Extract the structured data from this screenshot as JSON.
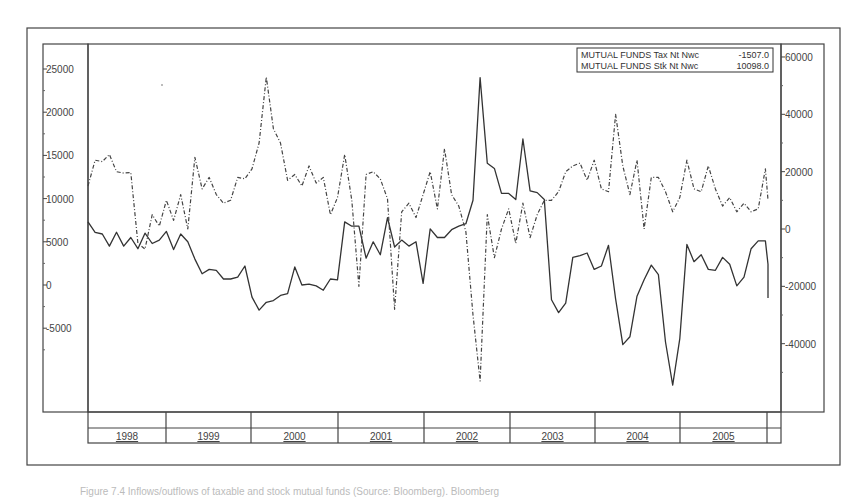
{
  "chart_data": {
    "type": "line",
    "title": "",
    "xlabel": "",
    "ylabel_left": "",
    "ylabel_right": "",
    "x_start": "1998-01",
    "x_step": "month",
    "x_tick_labels": [
      "1998",
      "1999",
      "2000",
      "2001",
      "2002",
      "2003",
      "2004",
      "2005"
    ],
    "left_axis": {
      "ticks": [
        25000,
        20000,
        15000,
        10000,
        5000,
        0,
        -5000
      ],
      "tick_labels": [
        "25000",
        "20000",
        "15000",
        "10000",
        "5000",
        "0",
        "-5000"
      ],
      "ylim": [
        -14500,
        28000
      ]
    },
    "right_axis": {
      "ticks": [
        60000,
        40000,
        20000,
        0,
        -20000,
        -40000
      ],
      "tick_labels": [
        "60000",
        "40000",
        "20000",
        "0",
        "-20000",
        "-40000"
      ],
      "ylim": [
        -63000,
        64000
      ]
    },
    "grid": false,
    "legend_position": "top-right inside plot",
    "series": [
      {
        "name": "MUTUAL FUNDS Tax Nt Nwc",
        "axis": "left",
        "style": "solid",
        "last_value": -1507.0,
        "values": [
          7300,
          6100,
          5900,
          4500,
          6100,
          4500,
          5500,
          4200,
          6000,
          4800,
          5200,
          6200,
          4100,
          5900,
          5000,
          3000,
          1300,
          1800,
          1700,
          700,
          700,
          900,
          2200,
          -1400,
          -2900,
          -2000,
          -1800,
          -1200,
          -1000,
          2100,
          0,
          100,
          -100,
          -600,
          700,
          600,
          7300,
          6800,
          6800,
          3100,
          5000,
          3500,
          7800,
          4400,
          5200,
          4500,
          5000,
          200,
          6500,
          5500,
          5500,
          6400,
          6800,
          7100,
          9800,
          24000,
          14100,
          13500,
          10600,
          10600,
          9900,
          16900,
          10900,
          10700,
          9900,
          -1700,
          -3200,
          -2100,
          3200,
          3400,
          3700,
          1800,
          2200,
          4600,
          -1600,
          -6900,
          -6000,
          -1300,
          600,
          2300,
          1200,
          -6600,
          -11600,
          -6200,
          4700,
          2700,
          3500,
          1800,
          1700,
          3200,
          2400,
          -100,
          900,
          4200,
          5100,
          5100,
          2400,
          -400,
          500,
          -1507
        ]
      },
      {
        "name": "MUTUAL FUNDS Stk Nt Nwc",
        "axis": "right",
        "style": "dashed",
        "last_value": 10098.0,
        "values": [
          15000,
          24000,
          23500,
          26000,
          20000,
          19500,
          19700,
          -5000,
          -7000,
          5000,
          1000,
          10000,
          3000,
          12000,
          0,
          25000,
          14000,
          18000,
          12000,
          9000,
          10000,
          18000,
          17500,
          21000,
          30000,
          53000,
          35000,
          30000,
          17000,
          19000,
          15000,
          22000,
          16000,
          18000,
          5000,
          11000,
          26000,
          10000,
          -20000,
          19000,
          20000,
          17500,
          10500,
          -28000,
          6000,
          9000,
          4000,
          12000,
          20000,
          7000,
          28000,
          12000,
          8000,
          -1000,
          -30000,
          -53000,
          5000,
          -10000,
          0,
          7000,
          -5000,
          9000,
          -3000,
          5000,
          10000,
          10000,
          13000,
          20000,
          22000,
          23000,
          17000,
          24000,
          14000,
          13000,
          40000,
          22000,
          12000,
          24000,
          0,
          18000,
          18000,
          13000,
          6000,
          11000,
          24000,
          14000,
          13000,
          22000,
          14000,
          8000,
          11000,
          6000,
          9000,
          6000,
          7000,
          21000,
          10098
        ]
      }
    ],
    "legend": [
      {
        "label": "MUTUAL FUNDS  Tax Nt Nwc",
        "value": "-1507.0"
      },
      {
        "label": "MUTUAL FUNDS  Stk Nt Nwc",
        "value": "10098.0"
      }
    ]
  },
  "caption": "Figure 7.4  Inflows/outflows of taxable and stock mutual funds (Source: Bloomberg). Bloomberg"
}
